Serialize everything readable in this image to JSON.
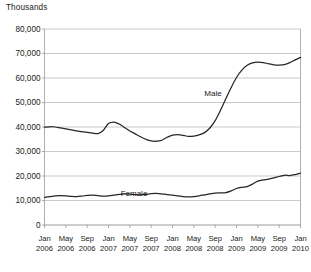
{
  "chart_data": {
    "type": "line",
    "title": "",
    "unit_label": "Thousands",
    "xlabel": "",
    "ylabel": "",
    "ylim": [
      0,
      80000
    ],
    "yticks": [
      0,
      10000,
      20000,
      30000,
      40000,
      50000,
      60000,
      70000,
      80000
    ],
    "ytick_labels": [
      "0",
      "10,000",
      "20,000",
      "30,000",
      "40,000",
      "50,000",
      "60,000",
      "70,000",
      "80,000"
    ],
    "grid": true,
    "legend_position": "inline",
    "xtick_labels": [
      {
        "month": "Jan",
        "year": "2006"
      },
      {
        "month": "May",
        "year": "2006"
      },
      {
        "month": "Sep",
        "year": "2006"
      },
      {
        "month": "Jan",
        "year": "2007"
      },
      {
        "month": "May",
        "year": "2007"
      },
      {
        "month": "Sep",
        "year": "2007"
      },
      {
        "month": "Jan",
        "year": "2008"
      },
      {
        "month": "May",
        "year": "2008"
      },
      {
        "month": "Sep",
        "year": "2008"
      },
      {
        "month": "Jan",
        "year": "2009"
      },
      {
        "month": "May",
        "year": "2009"
      },
      {
        "month": "Sep",
        "year": "2009"
      },
      {
        "month": "Jan",
        "year": "2010"
      }
    ],
    "x": [
      "2006-01",
      "2006-02",
      "2006-03",
      "2006-04",
      "2006-05",
      "2006-06",
      "2006-07",
      "2006-08",
      "2006-09",
      "2006-10",
      "2006-11",
      "2006-12",
      "2007-01",
      "2007-02",
      "2007-03",
      "2007-04",
      "2007-05",
      "2007-06",
      "2007-07",
      "2007-08",
      "2007-09",
      "2007-10",
      "2007-11",
      "2007-12",
      "2008-01",
      "2008-02",
      "2008-03",
      "2008-04",
      "2008-05",
      "2008-06",
      "2008-07",
      "2008-08",
      "2008-09",
      "2008-10",
      "2008-11",
      "2008-12",
      "2009-01",
      "2009-02",
      "2009-03",
      "2009-04",
      "2009-05",
      "2009-06",
      "2009-07",
      "2009-08",
      "2009-09",
      "2009-10",
      "2009-11",
      "2009-12",
      "2010-01"
    ],
    "series": [
      {
        "name": "Male",
        "label": "Male",
        "color": "#262626",
        "values": [
          39900,
          40100,
          40000,
          39600,
          39200,
          38800,
          38400,
          38100,
          37800,
          37500,
          37300,
          38600,
          41400,
          42000,
          41200,
          39800,
          38400,
          37200,
          36000,
          35000,
          34300,
          34200,
          34600,
          35800,
          36700,
          36900,
          36600,
          36200,
          36300,
          36800,
          37700,
          39600,
          42600,
          46800,
          51500,
          56100,
          60200,
          63200,
          65200,
          66200,
          66500,
          66300,
          65800,
          65400,
          65300,
          65500,
          66300,
          67400,
          68400
        ]
      },
      {
        "name": "Female",
        "label": "Female",
        "color": "#3a3a3a",
        "values": [
          11300,
          11600,
          11900,
          12000,
          11900,
          11700,
          11600,
          11800,
          12100,
          12200,
          12000,
          11800,
          11900,
          12200,
          12500,
          12700,
          12600,
          12400,
          12300,
          12500,
          12800,
          12900,
          12700,
          12400,
          12200,
          11900,
          11600,
          11500,
          11600,
          11900,
          12300,
          12700,
          13000,
          13100,
          13200,
          13900,
          14900,
          15400,
          15700,
          16700,
          17900,
          18400,
          18700,
          19200,
          19800,
          20300,
          20200,
          20600,
          21200
        ]
      }
    ]
  }
}
